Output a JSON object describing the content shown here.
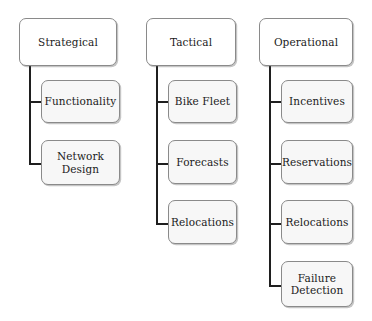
{
  "diagram": {
    "type": "tree-diagram",
    "canvas": {
      "width": 372,
      "height": 321,
      "background": "#ffffff"
    },
    "styles": {
      "root_fill": "#ffffff",
      "child_fill": "#f7f7f7",
      "border_color": "#8a8a8a",
      "connector_color": "#1f1f1f",
      "text_color": "#1b1b1b"
    },
    "columns": [
      {
        "id": "strategical",
        "root": {
          "label": "Strategical",
          "x": 19,
          "y": 18,
          "w": 98,
          "h": 48
        },
        "trunk": {
          "x": 29,
          "top": 66,
          "bottom": 163
        },
        "children": [
          {
            "label": "Functionality",
            "x": 41,
            "y": 80,
            "w": 79,
            "h": 43,
            "stub_y": 101
          },
          {
            "label": "Network\nDesign",
            "x": 41,
            "y": 140,
            "w": 79,
            "h": 45,
            "stub_y": 163
          }
        ]
      },
      {
        "id": "tactical",
        "root": {
          "label": "Tactical",
          "x": 146,
          "y": 18,
          "w": 90,
          "h": 48
        },
        "trunk": {
          "x": 156,
          "top": 66,
          "bottom": 223
        },
        "children": [
          {
            "label": "Bike Fleet",
            "x": 168,
            "y": 80,
            "w": 69,
            "h": 43,
            "stub_y": 101
          },
          {
            "label": "Forecasts",
            "x": 168,
            "y": 140,
            "w": 69,
            "h": 44,
            "stub_y": 163
          },
          {
            "label": "Relocations",
            "x": 168,
            "y": 200,
            "w": 69,
            "h": 44,
            "stub_y": 223
          }
        ]
      },
      {
        "id": "operational",
        "root": {
          "label": "Operational",
          "x": 259,
          "y": 18,
          "w": 94,
          "h": 48
        },
        "trunk": {
          "x": 269,
          "top": 66,
          "bottom": 285
        },
        "children": [
          {
            "label": "Incentives",
            "x": 281,
            "y": 80,
            "w": 72,
            "h": 43,
            "stub_y": 101
          },
          {
            "label": "Reservations",
            "x": 281,
            "y": 140,
            "w": 72,
            "h": 44,
            "stub_y": 163
          },
          {
            "label": "Relocations",
            "x": 281,
            "y": 200,
            "w": 72,
            "h": 44,
            "stub_y": 223
          },
          {
            "label": "Failure\nDetection",
            "x": 281,
            "y": 261,
            "w": 72,
            "h": 46,
            "stub_y": 285
          }
        ]
      }
    ]
  }
}
